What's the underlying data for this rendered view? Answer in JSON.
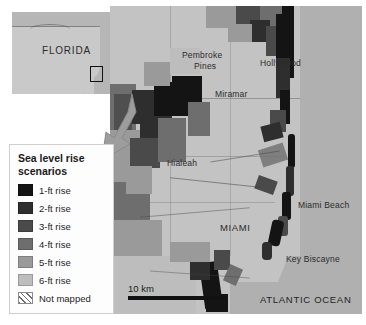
{
  "figure": {
    "kind": "thematic-map"
  },
  "inset": {
    "region_label": "FLORIDA",
    "locator_box_name": "study-area-locator-box"
  },
  "legend": {
    "title_line1": "Sea level rise",
    "title_line2": "scenarios",
    "items": [
      {
        "label": "1-ft rise",
        "color": "#141414"
      },
      {
        "label": "2-ft rise",
        "color": "#2e2e2e"
      },
      {
        "label": "3-ft rise",
        "color": "#4a4a4a"
      },
      {
        "label": "4-ft rise",
        "color": "#6e6e6e"
      },
      {
        "label": "5-ft rise",
        "color": "#9a9a9a"
      },
      {
        "label": "6-ft rise",
        "color": "#bdbdbd"
      },
      {
        "label": "Not mapped",
        "color": "hatched"
      }
    ]
  },
  "scale": {
    "label": "10 km"
  },
  "map_labels": {
    "pembroke_pines_line1": "Pembroke",
    "pembroke_pines_line2": "Pines",
    "hollywood": "Hollywood",
    "miramar": "Miramar",
    "hialeah": "Hialeah",
    "miami": "MIAMI",
    "miami_beach": "Miami Beach",
    "key_biscayne": "Key Biscayne",
    "atlantic_ocean": "ATLANTIC OCEAN"
  },
  "colors": {
    "ocean": "#b0b0b0",
    "land": "#c3c3c3",
    "background": "#ffffff",
    "legend_background": "#fdfdfd"
  }
}
